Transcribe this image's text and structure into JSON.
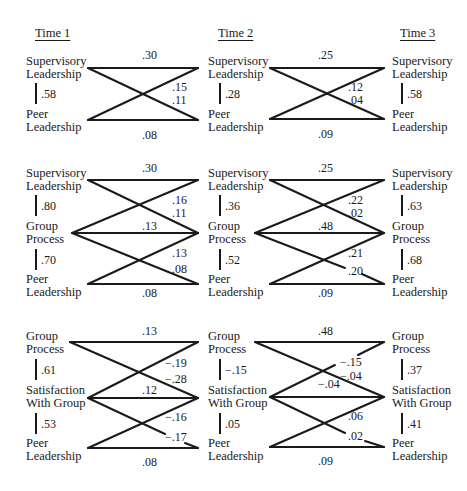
{
  "headers": {
    "time1": "Time 1",
    "time2": "Time 2",
    "time3": "Time 3"
  },
  "panels": [
    {
      "name": "supervisory-peer",
      "nodes": {
        "t1": [
          [
            "Supervisory",
            "Leadership"
          ],
          [
            "Peer",
            "Leadership"
          ]
        ],
        "t2": [
          [
            "Supervisory",
            "Leadership"
          ],
          [
            "Peer",
            "Leadership"
          ]
        ],
        "t3": [
          [
            "Supervisory",
            "Leadership"
          ],
          [
            "Peer",
            "Leadership"
          ]
        ]
      },
      "synchronous": {
        "t1": [
          ".58"
        ],
        "t2": [
          ".28"
        ],
        "t3": [
          ".58"
        ]
      },
      "paths_t1_t2": {
        "top": ".30",
        "cross_a": ".15",
        "cross_b": ".11",
        "bottom": ".08"
      },
      "paths_t2_t3": {
        "top": ".25",
        "cross_a": ".12",
        "cross_b": ".04",
        "bottom": ".09"
      }
    },
    {
      "name": "supervisory-group-peer",
      "nodes": {
        "t1": [
          [
            "Supervisory",
            "Leadership"
          ],
          [
            "Group",
            "Process"
          ],
          [
            "Peer",
            "Leadership"
          ]
        ],
        "t2": [
          [
            "Supervisory",
            "Leadership"
          ],
          [
            "Group",
            "Process"
          ],
          [
            "Peer",
            "Leadership"
          ]
        ],
        "t3": [
          [
            "Supervisory",
            "Leadership"
          ],
          [
            "Group",
            "Process"
          ],
          [
            "Peer",
            "Leadership"
          ]
        ]
      },
      "synchronous": {
        "t1": [
          ".80",
          ".70"
        ],
        "t2": [
          ".36",
          ".52"
        ],
        "t3": [
          ".63",
          ".68"
        ]
      },
      "paths_t1_t2": {
        "top": ".30",
        "cross_a": ".16",
        "cross_b": ".11",
        "middle": ".13",
        "cross_c": ".13",
        "cross_d": ".08",
        "bottom": ".08"
      },
      "paths_t2_t3": {
        "top": ".25",
        "cross_a": ".22",
        "cross_b": ".02",
        "middle": ".48",
        "cross_c": ".21",
        "cross_d": ".20",
        "bottom": ".09"
      }
    },
    {
      "name": "group-satisfaction-peer",
      "nodes": {
        "t1": [
          [
            "Group",
            "Process"
          ],
          [
            "Satisfaction",
            "With Group"
          ],
          [
            "Peer",
            "Leadership"
          ]
        ],
        "t2": [
          [
            "Group",
            "Process"
          ],
          [
            "Satisfaction",
            "With Group"
          ],
          [
            "Peer",
            "Leadership"
          ]
        ],
        "t3": [
          [
            "Group",
            "Process"
          ],
          [
            "Satisfaction",
            "With Group"
          ],
          [
            "Peer",
            "Leadership"
          ]
        ]
      },
      "synchronous": {
        "t1": [
          ".61",
          ".53"
        ],
        "t2": [
          "−.15",
          ".05"
        ],
        "t3": [
          ".37",
          ".41"
        ]
      },
      "paths_t1_t2": {
        "top": ".13",
        "cross_a": "−.19",
        "cross_b": "−.28",
        "middle": ".12",
        "cross_c": "−.16",
        "cross_d": "−.17",
        "bottom": ".08"
      },
      "paths_t2_t3": {
        "top": ".48",
        "cross_a": "−.15",
        "cross_b": "−.04",
        "middle": "−.04",
        "cross_c": ".06",
        "cross_d": ".02",
        "bottom": ".09"
      }
    }
  ]
}
